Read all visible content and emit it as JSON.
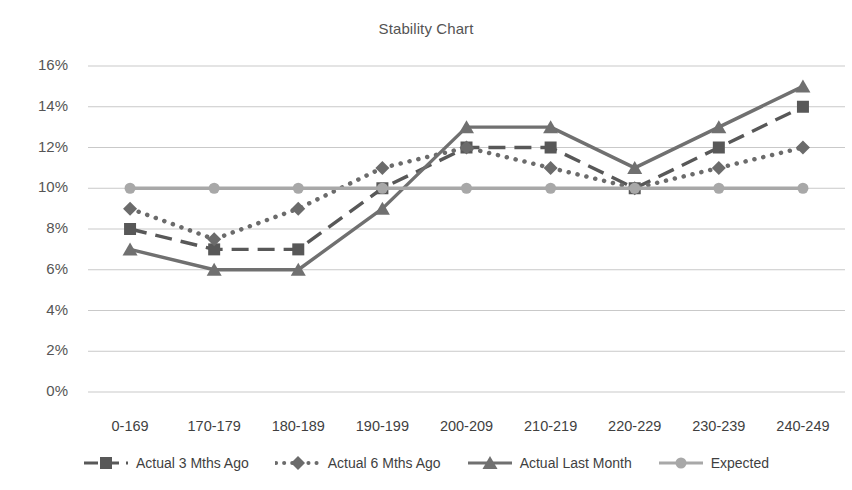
{
  "page": {
    "clipped_text_above": "",
    "background_color": "#ffffff"
  },
  "chart_data": {
    "type": "line",
    "title": "Stability Chart",
    "subtitle": "",
    "xlabel": "",
    "ylabel": "",
    "categories": [
      "0-169",
      "170-179",
      "180-189",
      "190-199",
      "200-209",
      "210-219",
      "220-229",
      "230-239",
      "240-249"
    ],
    "ylim": [
      0,
      16
    ],
    "ytick_labels": [
      "0%",
      "2%",
      "4%",
      "6%",
      "8%",
      "10%",
      "12%",
      "14%",
      "16%"
    ],
    "ytick_values": [
      0,
      2,
      4,
      6,
      8,
      10,
      12,
      14,
      16
    ],
    "grid": true,
    "grid_axis": "y",
    "legend_position": "bottom",
    "value_unit": "%",
    "series": [
      {
        "name": "Actual 3 Mths Ago",
        "values": [
          8,
          7,
          7,
          10,
          12,
          12,
          10,
          12,
          14
        ],
        "color": "#585858",
        "line_style": "dashed",
        "marker": "square"
      },
      {
        "name": "Actual 6 Mths Ago",
        "values": [
          9,
          7.5,
          9,
          11,
          12,
          11,
          10,
          11,
          12
        ],
        "color": "#6b6b6b",
        "line_style": "dotted",
        "marker": "diamond"
      },
      {
        "name": "Actual Last Month",
        "values": [
          7,
          6,
          6,
          9,
          13,
          13,
          11,
          13,
          15
        ],
        "color": "#707070",
        "line_style": "solid",
        "marker": "triangle"
      },
      {
        "name": "Expected",
        "values": [
          10,
          10,
          10,
          10,
          10,
          10,
          10,
          10,
          10
        ],
        "color": "#a8a8a8",
        "line_style": "solid",
        "marker": "circle"
      }
    ]
  },
  "legend": {
    "items": [
      {
        "label": "Actual 3 Mths Ago",
        "marker": "square-marker"
      },
      {
        "label": "Actual 6 Mths Ago",
        "marker": "diamond-marker"
      },
      {
        "label": "Actual Last Month",
        "marker": "triangle-marker"
      },
      {
        "label": "Expected",
        "marker": "circle-marker"
      }
    ]
  },
  "axis": {
    "y_labels": [
      "16%",
      "14%",
      "12%",
      "10%",
      "8%",
      "6%",
      "4%",
      "2%",
      "0%"
    ],
    "x_labels": [
      "0-169",
      "170-179",
      "180-189",
      "190-199",
      "200-209",
      "210-219",
      "220-229",
      "230-239",
      "240-249"
    ]
  }
}
